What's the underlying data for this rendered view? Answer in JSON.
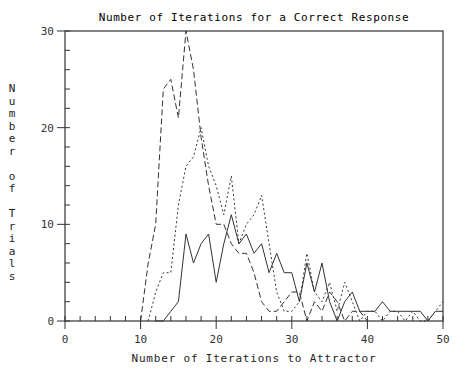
{
  "chart_data": {
    "type": "line",
    "title": "Number of Iterations for a Correct Response",
    "xlabel": "Number of Iterations to Attractor",
    "ylabel": "Number of Trials",
    "xlim": [
      0,
      50
    ],
    "ylim": [
      0,
      30
    ],
    "x_ticks": [
      0,
      10,
      20,
      30,
      40,
      50
    ],
    "y_ticks": [
      0,
      10,
      20,
      30
    ],
    "x_minor_step": 2,
    "y_minor_step": 2,
    "grid": false,
    "legend": null,
    "series": [
      {
        "name": "long-dash",
        "style": "long-dash",
        "x": [
          10,
          11,
          12,
          13,
          14,
          15,
          16,
          17,
          18,
          19,
          20,
          21,
          22,
          23,
          24,
          25,
          26,
          27,
          28,
          29,
          30,
          31,
          32,
          33,
          34,
          35,
          36,
          37,
          38,
          39,
          40
        ],
        "values": [
          0,
          6,
          10,
          24,
          25,
          21,
          30,
          26,
          19,
          14,
          10,
          10,
          8,
          7,
          7,
          5,
          2,
          1,
          1,
          2,
          3,
          3,
          0,
          2,
          1,
          3,
          2,
          0,
          1,
          1,
          0
        ]
      },
      {
        "name": "dotted",
        "style": "dotted",
        "x": [
          11,
          12,
          13,
          14,
          15,
          16,
          17,
          18,
          19,
          20,
          21,
          22,
          23,
          24,
          25,
          26,
          27,
          28,
          29,
          30,
          31,
          32,
          33,
          34,
          35,
          36,
          37,
          38,
          39,
          40,
          41,
          42,
          43,
          44,
          45,
          46,
          47,
          48,
          49,
          50
        ],
        "values": [
          0,
          3,
          5,
          5,
          12,
          16,
          17,
          20,
          16,
          14,
          11,
          15,
          8,
          10,
          11,
          13,
          8,
          3,
          1,
          1,
          2,
          7,
          3,
          2,
          4,
          1,
          4,
          2,
          0,
          1,
          1,
          0,
          1,
          1,
          0,
          1,
          0,
          0,
          1,
          2
        ]
      },
      {
        "name": "solid",
        "style": "solid",
        "x": [
          12,
          13,
          14,
          15,
          16,
          17,
          18,
          19,
          20,
          21,
          22,
          23,
          24,
          25,
          26,
          27,
          28,
          29,
          30,
          31,
          32,
          33,
          34,
          35,
          36,
          37,
          38,
          39,
          40,
          41,
          42,
          43,
          44,
          45,
          46,
          47,
          48,
          49,
          50
        ],
        "values": [
          0,
          0,
          1,
          2,
          9,
          6,
          8,
          9,
          4,
          8,
          11,
          8,
          9,
          7,
          8,
          5,
          7,
          5,
          5,
          2,
          6,
          3,
          6,
          2,
          0,
          2,
          3,
          1,
          1,
          1,
          2,
          1,
          1,
          1,
          1,
          1,
          0,
          1,
          1
        ]
      }
    ]
  },
  "labels": {
    "title": "Number of Iterations for a Correct Response",
    "xlabel": "Number of Iterations to Attractor",
    "ylabel_chars": [
      "N",
      "u",
      "m",
      "b",
      "e",
      "r",
      "",
      "o",
      "f",
      "",
      "T",
      "r",
      "i",
      "a",
      "l",
      "s"
    ]
  }
}
